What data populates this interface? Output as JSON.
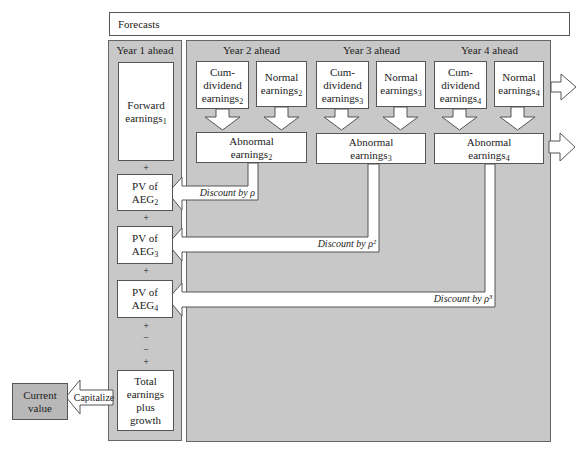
{
  "forecasts_label": "Forecasts",
  "year1": {
    "header": "Year 1 ahead",
    "forward_earnings": {
      "text": "Forward",
      "text2": "earnings",
      "sub": "1"
    },
    "pv_aeg2": {
      "line1": "PV of",
      "line2": "AEG",
      "sub": "2"
    },
    "pv_aeg3": {
      "line1": "PV of",
      "line2": "AEG",
      "sub": "3"
    },
    "pv_aeg4": {
      "line1": "PV of",
      "line2": "AEG",
      "sub": "4"
    },
    "operators": [
      "+",
      "+",
      "+",
      "+",
      "−",
      "−",
      "+"
    ],
    "total": {
      "line1": "Total",
      "line2": "earnings",
      "line3": "plus",
      "line4": "growth"
    }
  },
  "years": [
    {
      "header": "Year 2 ahead",
      "cum": {
        "l1": "Cum-",
        "l2": "dividend",
        "l3": "earnings",
        "sub": "2"
      },
      "normal": {
        "l1": "Normal",
        "l2": "earnings",
        "sub": "2"
      },
      "abnormal": {
        "l1": "Abnormal",
        "l2": "earnings",
        "sub": "2"
      },
      "discount": "Discount by ρ"
    },
    {
      "header": "Year 3 ahead",
      "cum": {
        "l1": "Cum-",
        "l2": "dividend",
        "l3": "earnings",
        "sub": "3"
      },
      "normal": {
        "l1": "Normal",
        "l2": "earnings",
        "sub": "3"
      },
      "abnormal": {
        "l1": "Abnormal",
        "l2": "earnings",
        "sub": "3"
      },
      "discount": "Discount by ρ²"
    },
    {
      "header": "Year 4 ahead",
      "cum": {
        "l1": "Cum-",
        "l2": "dividend",
        "l3": "earnings",
        "sub": "4"
      },
      "normal": {
        "l1": "Normal",
        "l2": "earnings",
        "sub": "4"
      },
      "abnormal": {
        "l1": "Abnormal",
        "l2": "earnings",
        "sub": "4"
      },
      "discount": "Discount by ρ³"
    }
  ],
  "current_value": {
    "l1": "Current",
    "l2": "value"
  },
  "capitalize_label": "Capitalize",
  "colors": {
    "panel": "#c8c8c8",
    "current_value_fill": "#b8b8b8",
    "border": "#555555"
  }
}
